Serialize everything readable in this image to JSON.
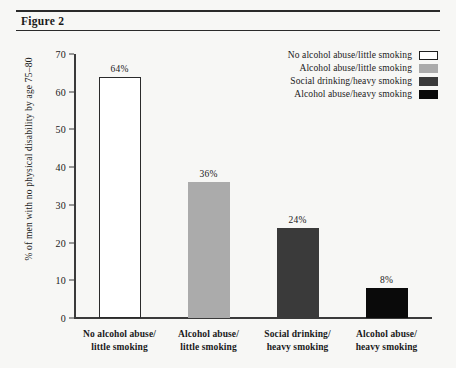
{
  "figure": {
    "caption": "Figure 2"
  },
  "chart_data": {
    "type": "bar",
    "title": "Figure 2",
    "xlabel": "",
    "ylabel": "% of men with no physical disability by age 75–80",
    "ylim": [
      0,
      70
    ],
    "yticks": [
      0,
      10,
      20,
      30,
      40,
      50,
      60,
      70
    ],
    "grid": false,
    "legend_position": "top-right",
    "categories": [
      "No alcohol abuse/\nlittle smoking",
      "Alcohol abuse/\nlittle smoking",
      "Social drinking/\nheavy smoking",
      "Alcohol abuse/\nheavy smoking"
    ],
    "category_lines": [
      [
        "No alcohol abuse/",
        "little smoking"
      ],
      [
        "Alcohol abuse/",
        "little smoking"
      ],
      [
        "Social drinking/",
        "heavy smoking"
      ],
      [
        "Alcohol abuse/",
        "heavy smoking"
      ]
    ],
    "values": [
      64,
      36,
      24,
      8
    ],
    "value_labels": [
      "64%",
      "36%",
      "24%",
      "8%"
    ],
    "colors": [
      "#ffffff",
      "#ababab",
      "#3a3a3a",
      "#0a0a0a"
    ],
    "legend": [
      {
        "label": "No alcohol abuse/little smoking",
        "color": "#ffffff"
      },
      {
        "label": "Alcohol abuse/little smoking",
        "color": "#ababab"
      },
      {
        "label": "Social drinking/heavy smoking",
        "color": "#3a3a3a"
      },
      {
        "label": "Alcohol abuse/heavy smoking",
        "color": "#0a0a0a"
      }
    ]
  },
  "axis": {
    "ytick_labels": [
      "70",
      "60",
      "50",
      "40",
      "30",
      "20",
      "10",
      "0"
    ]
  }
}
